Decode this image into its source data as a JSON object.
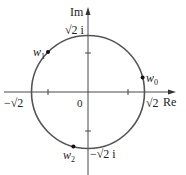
{
  "diagram": {
    "axes": {
      "x_label": "Re",
      "y_label": "Im",
      "origin_label": "0"
    },
    "circle": {
      "radius_label": "√2",
      "color": "#555555"
    },
    "tick_labels": {
      "pos_real": "√2",
      "neg_real": "−√2",
      "pos_imag": "√2 i",
      "neg_imag": "−√2 i"
    },
    "points": [
      {
        "name": "w",
        "sub": "0",
        "angle_deg": 15
      },
      {
        "name": "w",
        "sub": "1",
        "angle_deg": 135
      },
      {
        "name": "w",
        "sub": "2",
        "angle_deg": 255
      }
    ],
    "colors": {
      "axis": "#333333",
      "circle": "#555555",
      "point": "#111111"
    }
  }
}
